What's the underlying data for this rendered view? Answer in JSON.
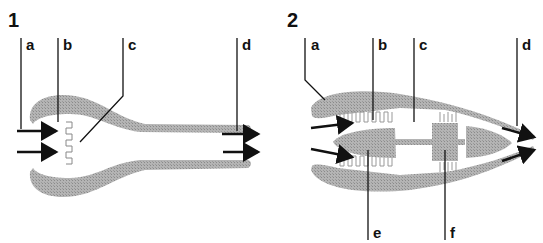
{
  "top_clipped_text": "... diagrams",
  "figures": [
    {
      "number": "1",
      "description": "Ramjet engine cross-section",
      "labels": [
        "a",
        "b",
        "c",
        "d"
      ]
    },
    {
      "number": "2",
      "description": "Turbojet engine cross-section",
      "labels": [
        "a",
        "b",
        "c",
        "d",
        "e",
        "f"
      ]
    }
  ],
  "colors": {
    "body_fill": "#a8a8a8",
    "line": "#111111",
    "background": "#ffffff"
  }
}
